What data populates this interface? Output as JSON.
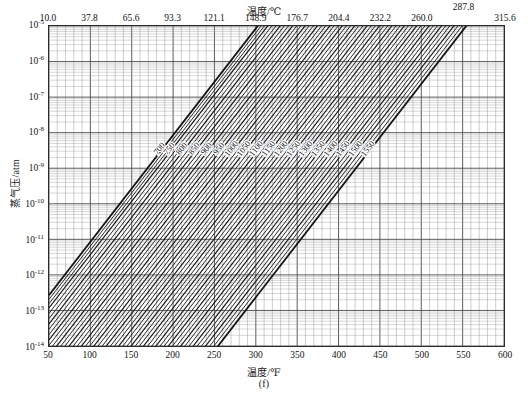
{
  "figure": {
    "caption": "(f)",
    "top_axis_title": "温度/℃",
    "bottom_axis_title": "温度/℉",
    "y_axis_title": "蒸气压/atm"
  },
  "chart_data": {
    "type": "line",
    "title": "",
    "subtitle": "",
    "xlabel": "温度/℉",
    "ylabel": "蒸气压/atm",
    "x2label": "温度/℃",
    "xscale": "linear",
    "yscale": "log",
    "xlim": [
      50,
      600
    ],
    "ylim": [
      1e-14,
      1e-05
    ],
    "grid": true,
    "legend": "none",
    "x_ticks": [
      50,
      100,
      150,
      200,
      250,
      300,
      350,
      400,
      450,
      500,
      550,
      600
    ],
    "x_tick_labels": [
      "50",
      "100",
      "150",
      "200",
      "250",
      "300",
      "350",
      "400",
      "450",
      "500",
      "550",
      "600"
    ],
    "x2_ticks": [
      50,
      100,
      150,
      200,
      250,
      300,
      350,
      400,
      450,
      500,
      550,
      600
    ],
    "x2_tick_labels": [
      "10.0",
      "37.8",
      "65.6",
      "93.3",
      "121.1",
      "148.9",
      "176.7",
      "204.4",
      "232.2",
      "260.0",
      "287.8",
      "315.6"
    ],
    "y_ticks": [
      1e-05,
      1e-06,
      1e-07,
      1e-08,
      1e-09,
      1e-10,
      1e-11,
      1e-12,
      1e-13,
      1e-14
    ],
    "y_tick_labels": [
      "10<sup>-5</sup>",
      "10<sup>-6</sup>",
      "10<sup>-7</sup>",
      "10<sup>-8</sup>",
      "10<sup>-9</sup>",
      "10<sup>-10</sup>",
      "10<sup>-11</sup>",
      "10<sup>-12</sup>",
      "10<sup>-13</sup>",
      "10<sup>-14</sup>"
    ],
    "series_label_note": "Each diagonal line is an iso-parameter contour labelled with its value",
    "series": [
      {
        "name": "700",
        "label": "700",
        "x1": 169,
        "y1": 1e-09,
        "x2": 600,
        "y2": 7e-05
      },
      {
        "name": "750",
        "label": "750",
        "x1": 181,
        "y1": 1e-09,
        "x2": 600,
        "y2": 3e-05
      },
      {
        "name": "800",
        "label": "800",
        "x1": 196,
        "y1": 1e-09,
        "x2": 600,
        "y2": 1.3e-05
      },
      {
        "name": "850",
        "label": "850",
        "x1": 211,
        "y1": 1e-09,
        "x2": 600,
        "y2": 6e-06
      },
      {
        "name": "900",
        "label": "900",
        "x1": 226,
        "y1": 1e-09,
        "x2": 600,
        "y2": 2.6e-06
      },
      {
        "name": "950",
        "label": "950",
        "x1": 241,
        "y1": 1e-09,
        "x2": 600,
        "y2": 1.1e-06
      },
      {
        "name": "1000",
        "label": "1000",
        "x1": 256,
        "y1": 1e-09,
        "x2": 600,
        "y2": 5e-07
      },
      {
        "name": "1050",
        "label": "1050",
        "x1": 271,
        "y1": 1e-09,
        "x2": 600,
        "y2": 2.2e-07
      },
      {
        "name": "1100",
        "label": "1100",
        "x1": 286,
        "y1": 1e-09,
        "x2": 600,
        "y2": 9.5e-08
      },
      {
        "name": "1150",
        "label": "1150",
        "x1": 301,
        "y1": 1e-09,
        "x2": 600,
        "y2": 4.2e-08
      },
      {
        "name": "1200",
        "label": "1200",
        "x1": 316,
        "y1": 1e-09,
        "x2": 600,
        "y2": 1.8e-08
      },
      {
        "name": "1250",
        "label": "1250",
        "x1": 331,
        "y1": 1e-09,
        "x2": 600,
        "y2": 8e-09
      },
      {
        "name": "1300",
        "label": "1300",
        "x1": 346,
        "y1": 1e-09,
        "x2": 600,
        "y2": 3.5e-09
      },
      {
        "name": "1350",
        "label": "1350",
        "x1": 361,
        "y1": 1e-09,
        "x2": 600,
        "y2": 1.5e-09
      },
      {
        "name": "1400",
        "label": "1400",
        "x1": 376,
        "y1": 1e-09,
        "x2": 600,
        "y2": 6.5e-10
      },
      {
        "name": "1450",
        "label": "1450",
        "x1": 391,
        "y1": 1e-09,
        "x2": 600,
        "y2": 2.9e-10
      },
      {
        "name": "1500",
        "label": "1500",
        "x1": 406,
        "y1": 1e-09,
        "x2": 600,
        "y2": 1.3e-10
      },
      {
        "name": "1550",
        "label": "1550",
        "x1": 421,
        "y1": 1e-09,
        "x2": 600,
        "y2": 5.5e-11
      }
    ],
    "contour_labels": [
      "700",
      "750",
      "800",
      "850",
      "900",
      "950",
      "1000",
      "1050",
      "1100",
      "1150",
      "1200",
      "1250",
      "1300",
      "1350",
      "1400",
      "1450",
      "1500",
      "1550"
    ]
  }
}
